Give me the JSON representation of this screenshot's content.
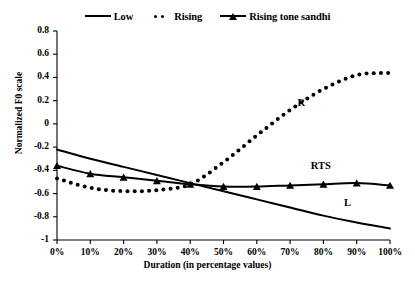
{
  "legend": {
    "items": [
      {
        "label": "Low",
        "style": "solid",
        "icon": "solid-line-icon"
      },
      {
        "label": "Rising",
        "style": "dotted",
        "icon": "dotted-line-icon"
      },
      {
        "label": "Rising tone sandhi",
        "style": "marker",
        "icon": "line-triangle-marker-icon"
      }
    ]
  },
  "axes": {
    "y_title": "Normalized F0 scale",
    "x_title": "Duration (in percentage values)",
    "y_ticks": [
      "0.8",
      "0.6",
      "0.4",
      "0.2",
      "0",
      "-0.2",
      "-0.4",
      "-0.6",
      "-0.8",
      "-1"
    ],
    "x_ticks": [
      "0%",
      "10%",
      "20%",
      "30%",
      "40%",
      "50%",
      "60%",
      "70%",
      "80%",
      "90%",
      "100%"
    ]
  },
  "annotations": [
    {
      "text": "R",
      "x_pct": 74,
      "y_val": 0.16
    },
    {
      "text": "RTS",
      "x_pct": 78,
      "y_val": -0.38
    },
    {
      "text": "L",
      "x_pct": 88,
      "y_val": -0.7
    }
  ],
  "chart_data": {
    "type": "line",
    "title": "",
    "xlabel": "Duration (in percentage values)",
    "ylabel": "Normalized F0 scale",
    "xlim": [
      0,
      100
    ],
    "ylim": [
      -1,
      0.8
    ],
    "ytick_step": 0.2,
    "grid": false,
    "legend_position": "top-center",
    "categories": [
      "0%",
      "10%",
      "20%",
      "30%",
      "40%",
      "50%",
      "60%",
      "70%",
      "80%",
      "90%",
      "100%"
    ],
    "x": [
      0,
      10,
      20,
      30,
      40,
      50,
      60,
      70,
      80,
      90,
      100
    ],
    "series": [
      {
        "name": "Low",
        "short": "L",
        "style": "solid",
        "values": [
          -0.22,
          -0.3,
          -0.37,
          -0.44,
          -0.51,
          -0.58,
          -0.65,
          -0.72,
          -0.79,
          -0.85,
          -0.9
        ]
      },
      {
        "name": "Rising",
        "short": "R",
        "style": "dotted",
        "values": [
          -0.47,
          -0.55,
          -0.58,
          -0.57,
          -0.52,
          -0.33,
          -0.1,
          0.12,
          0.3,
          0.42,
          0.44
        ]
      },
      {
        "name": "Rising tone sandhi",
        "short": "RTS",
        "style": "solid-triangle-markers",
        "values": [
          -0.36,
          -0.43,
          -0.46,
          -0.49,
          -0.52,
          -0.54,
          -0.54,
          -0.53,
          -0.52,
          -0.51,
          -0.53
        ]
      }
    ]
  },
  "colors": {
    "line": "#000000",
    "axis": "#000000",
    "background": "#ffffff"
  }
}
